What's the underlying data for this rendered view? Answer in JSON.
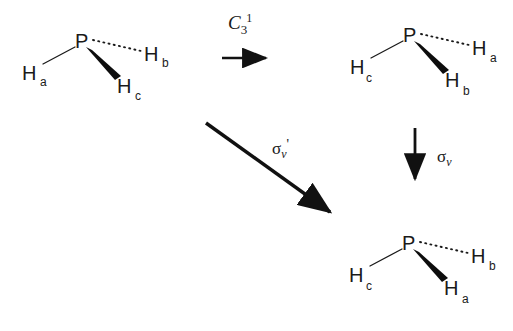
{
  "figure": {
    "background_color": "#ffffff",
    "ink_color": "#1a1a1a"
  },
  "molecules": [
    {
      "id": "molecule-start",
      "center_atom": "P",
      "position": {
        "x": 82,
        "y": 42
      },
      "substituents": [
        {
          "label": "H",
          "subscript": "a",
          "bond": "plain",
          "label_x": 22,
          "label_y": 63,
          "sub_x": 40,
          "sub_y": 76
        },
        {
          "label": "H",
          "subscript": "b",
          "bond": "dashed",
          "label_x": 144,
          "label_y": 44,
          "sub_x": 162,
          "sub_y": 57
        },
        {
          "label": "H",
          "subscript": "c",
          "bond": "wedge",
          "label_x": 117,
          "label_y": 76,
          "sub_x": 135,
          "sub_y": 89
        }
      ]
    },
    {
      "id": "molecule-c3-product",
      "center_atom": "P",
      "position": {
        "x": 410,
        "y": 36
      },
      "substituents": [
        {
          "label": "H",
          "subscript": "c",
          "bond": "plain",
          "label_x": 350,
          "label_y": 57,
          "sub_x": 366,
          "sub_y": 72
        },
        {
          "label": "H",
          "subscript": "a",
          "bond": "dashed",
          "label_x": 472,
          "label_y": 38,
          "sub_x": 490,
          "sub_y": 52
        },
        {
          "label": "H",
          "subscript": "b",
          "bond": "wedge",
          "label_x": 445,
          "label_y": 70,
          "sub_x": 463,
          "sub_y": 84
        }
      ]
    },
    {
      "id": "molecule-sigma-product",
      "center_atom": "P",
      "position": {
        "x": 409,
        "y": 244
      },
      "substituents": [
        {
          "label": "H",
          "subscript": "c",
          "bond": "plain",
          "label_x": 349,
          "label_y": 265,
          "sub_x": 366,
          "sub_y": 280
        },
        {
          "label": "H",
          "subscript": "b",
          "bond": "dashed",
          "label_x": 471,
          "label_y": 246,
          "sub_x": 489,
          "sub_y": 260
        },
        {
          "label": "H",
          "subscript": "a",
          "bond": "wedge",
          "label_x": 444,
          "label_y": 278,
          "sub_x": 462,
          "sub_y": 292
        }
      ]
    }
  ],
  "operations": [
    {
      "id": "operation-c3",
      "symbol": "C",
      "subscript": "3",
      "superscript": "1",
      "prime": "",
      "label_x": 228,
      "label_y": 12,
      "arrow": "horizontal-right"
    },
    {
      "id": "operation-sigma-v-prime",
      "symbol": "σ",
      "subscript": "v",
      "superscript": "",
      "prime": "'",
      "label_x": 272,
      "label_y": 138,
      "arrow": "diagonal-down-right"
    },
    {
      "id": "operation-sigma-v",
      "symbol": "σ",
      "subscript": "v",
      "superscript": "",
      "prime": "",
      "label_x": 437,
      "label_y": 148,
      "arrow": "vertical-down"
    }
  ]
}
